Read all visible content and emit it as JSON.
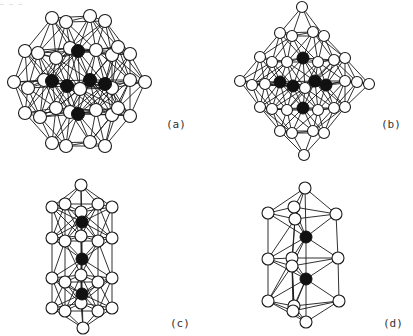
{
  "figure": {
    "top_fragment": "— — —",
    "panels": [
      {
        "id": "a",
        "label": "(a)",
        "label_pos": [
          166,
          118
        ],
        "white_r": 6.5,
        "black_r": 6.5,
        "white": [
          [
            52,
            18
          ],
          [
            66,
            22
          ],
          [
            90,
            16
          ],
          [
            105,
            21
          ],
          [
            25,
            51
          ],
          [
            38,
            53
          ],
          [
            56,
            58
          ],
          [
            70,
            48
          ],
          [
            96,
            50
          ],
          [
            112,
            55
          ],
          [
            118,
            47
          ],
          [
            130,
            54
          ],
          [
            14,
            82
          ],
          [
            28,
            88
          ],
          [
            44,
            80
          ],
          [
            80,
            89
          ],
          [
            112,
            88
          ],
          [
            130,
            80
          ],
          [
            145,
            82
          ],
          [
            25,
            113
          ],
          [
            40,
            117
          ],
          [
            56,
            108
          ],
          [
            70,
            112
          ],
          [
            96,
            110
          ],
          [
            112,
            115
          ],
          [
            118,
            108
          ],
          [
            130,
            116
          ],
          [
            52,
            143
          ],
          [
            66,
            146
          ],
          [
            90,
            142
          ],
          [
            105,
            146
          ]
        ],
        "black": [
          [
            78,
            51
          ],
          [
            52,
            81
          ],
          [
            67,
            86
          ],
          [
            90,
            80
          ],
          [
            105,
            84
          ],
          [
            78,
            114
          ]
        ]
      },
      {
        "id": "b",
        "label": "(b)",
        "label_pos": [
          381,
          118
        ],
        "white_r": 5.5,
        "black_r": 6,
        "white": [
          [
            302,
            7
          ],
          [
            280,
            33
          ],
          [
            292,
            36
          ],
          [
            313,
            32
          ],
          [
            324,
            36
          ],
          [
            260,
            57
          ],
          [
            272,
            62
          ],
          [
            287,
            62
          ],
          [
            318,
            62
          ],
          [
            334,
            60
          ],
          [
            345,
            58
          ],
          [
            240,
            81
          ],
          [
            252,
            85
          ],
          [
            265,
            84
          ],
          [
            305,
            88
          ],
          [
            345,
            81
          ],
          [
            357,
            82
          ],
          [
            369,
            84
          ],
          [
            260,
            107
          ],
          [
            272,
            109
          ],
          [
            287,
            110
          ],
          [
            318,
            110
          ],
          [
            334,
            108
          ],
          [
            345,
            107
          ],
          [
            280,
            131
          ],
          [
            292,
            133
          ],
          [
            313,
            131
          ],
          [
            324,
            133
          ],
          [
            304,
            155
          ]
        ],
        "black": [
          [
            303,
            58
          ],
          [
            280,
            82
          ],
          [
            293,
            86
          ],
          [
            315,
            81
          ],
          [
            326,
            85
          ],
          [
            303,
            108
          ]
        ]
      },
      {
        "id": "c",
        "label": "(c)",
        "label_pos": [
          170,
          317
        ],
        "white_r": 6,
        "black_r": 6,
        "white": [
          [
            81,
            185
          ],
          [
            52,
            207
          ],
          [
            65,
            204
          ],
          [
            81,
            212
          ],
          [
            98,
            204
          ],
          [
            112,
            207
          ],
          [
            52,
            238
          ],
          [
            65,
            241
          ],
          [
            81,
            236
          ],
          [
            98,
            241
          ],
          [
            112,
            238
          ],
          [
            52,
            278
          ],
          [
            65,
            282
          ],
          [
            81,
            275
          ],
          [
            98,
            282
          ],
          [
            112,
            278
          ],
          [
            52,
            308
          ],
          [
            65,
            311
          ],
          [
            81,
            303
          ],
          [
            98,
            311
          ],
          [
            112,
            308
          ],
          [
            83,
            328
          ]
        ],
        "black": [
          [
            82,
            222
          ],
          [
            82,
            259
          ],
          [
            82,
            294
          ]
        ]
      },
      {
        "id": "d",
        "label": "(d)",
        "label_pos": [
          383,
          317
        ],
        "white_r": 6,
        "black_r": 6,
        "white": [
          [
            305,
            188
          ],
          [
            268,
            213
          ],
          [
            294,
            207
          ],
          [
            295,
            219
          ],
          [
            336,
            214
          ],
          [
            268,
            259
          ],
          [
            292,
            258
          ],
          [
            292,
            266
          ],
          [
            338,
            258
          ],
          [
            268,
            301
          ],
          [
            294,
            306
          ],
          [
            293,
            311
          ],
          [
            339,
            301
          ],
          [
            306,
            322
          ]
        ],
        "black": [
          [
            306,
            237
          ],
          [
            306,
            279
          ]
        ]
      }
    ]
  }
}
